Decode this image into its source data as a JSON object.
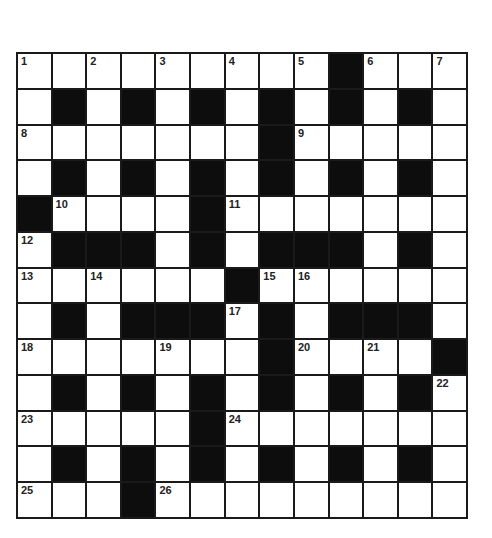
{
  "puzzle": {
    "rows": 13,
    "cols": 13,
    "colors": {
      "black": "#0d0d0d",
      "white": "#ffffff",
      "border": "#1a1a1a"
    },
    "layout": [
      "WWWWWWWWWBWWW",
      "WBWBWBWBWBWBW",
      "WWWWWWWBWWWWW",
      "WBWBWBWBWBWBW",
      "BWWWWBWWWWWWW",
      "WBBBWBWBBBWBW",
      "WWWWWWBWWWWWW",
      "WBWBBBWBWBBBW",
      "WWWWWWWBWWWWB",
      "WBWBWBWBWBWBW",
      "WWWWWBWWWWWWW",
      "WBWBWBWBWBWBW",
      "WWWBWWWWWWWWW"
    ],
    "numbers": [
      {
        "r": 0,
        "c": 0,
        "n": "1"
      },
      {
        "r": 0,
        "c": 2,
        "n": "2"
      },
      {
        "r": 0,
        "c": 4,
        "n": "3"
      },
      {
        "r": 0,
        "c": 6,
        "n": "4"
      },
      {
        "r": 0,
        "c": 8,
        "n": "5"
      },
      {
        "r": 0,
        "c": 10,
        "n": "6"
      },
      {
        "r": 0,
        "c": 12,
        "n": "7"
      },
      {
        "r": 2,
        "c": 0,
        "n": "8"
      },
      {
        "r": 2,
        "c": 8,
        "n": "9"
      },
      {
        "r": 4,
        "c": 1,
        "n": "10"
      },
      {
        "r": 4,
        "c": 6,
        "n": "11"
      },
      {
        "r": 5,
        "c": 0,
        "n": "12"
      },
      {
        "r": 6,
        "c": 0,
        "n": "13"
      },
      {
        "r": 6,
        "c": 2,
        "n": "14"
      },
      {
        "r": 6,
        "c": 7,
        "n": "15"
      },
      {
        "r": 6,
        "c": 8,
        "n": "16"
      },
      {
        "r": 7,
        "c": 6,
        "n": "17"
      },
      {
        "r": 8,
        "c": 0,
        "n": "18"
      },
      {
        "r": 8,
        "c": 4,
        "n": "19"
      },
      {
        "r": 8,
        "c": 8,
        "n": "20"
      },
      {
        "r": 8,
        "c": 10,
        "n": "21"
      },
      {
        "r": 9,
        "c": 12,
        "n": "22"
      },
      {
        "r": 10,
        "c": 0,
        "n": "23"
      },
      {
        "r": 10,
        "c": 6,
        "n": "24"
      },
      {
        "r": 12,
        "c": 0,
        "n": "25"
      },
      {
        "r": 12,
        "c": 4,
        "n": "26"
      }
    ]
  }
}
